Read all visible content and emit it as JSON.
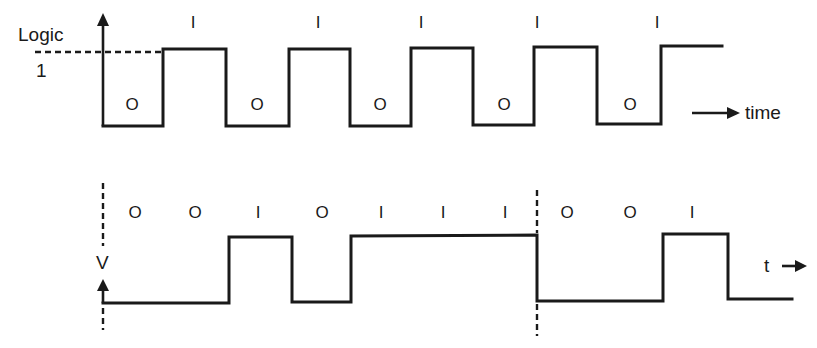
{
  "colors": {
    "ink": "#1a1a1a",
    "background": "#ffffff"
  },
  "top_diagram": {
    "y_axis_label": "Logic",
    "level_label": "1",
    "x_axis_label": "time",
    "axis_x": 103,
    "high_y": 49,
    "low_y": 126,
    "waveform_points": "103,126 163,126 163,49 226,49 226,126 289,126 289,49 350,49 350,126 411,126 411,48 473,48 473,125 534,125 534,47 597,47 597,124 661,124 661,46 722,46",
    "bits": [
      {
        "label": "O",
        "x": 132,
        "y": 110
      },
      {
        "label": "I",
        "x": 193,
        "y": 28
      },
      {
        "label": "O",
        "x": 257,
        "y": 110
      },
      {
        "label": "I",
        "x": 318,
        "y": 28
      },
      {
        "label": "O",
        "x": 380,
        "y": 110
      },
      {
        "label": "I",
        "x": 421,
        "y": 28
      },
      {
        "label": "O",
        "x": 504,
        "y": 110
      },
      {
        "label": "I",
        "x": 537,
        "y": 28
      },
      {
        "label": "O",
        "x": 630,
        "y": 110
      },
      {
        "label": "I",
        "x": 657,
        "y": 28
      }
    ]
  },
  "bottom_diagram": {
    "y_axis_label": "V",
    "x_axis_label": "t",
    "axis_x": 103,
    "boundary_x": 537,
    "waveform_points": "103,303 229,303 229,237 292,237 292,302 351,302 351,236 537,235 537,301 663,301 663,234 728,234 728,299 792,299",
    "bits": [
      {
        "label": "O",
        "x": 135,
        "y": 218
      },
      {
        "label": "O",
        "x": 195,
        "y": 218
      },
      {
        "label": "I",
        "x": 258,
        "y": 218
      },
      {
        "label": "O",
        "x": 322,
        "y": 218
      },
      {
        "label": "I",
        "x": 381,
        "y": 218
      },
      {
        "label": "I",
        "x": 443,
        "y": 218
      },
      {
        "label": "I",
        "x": 505,
        "y": 218
      },
      {
        "label": "O",
        "x": 567,
        "y": 218
      },
      {
        "label": "O",
        "x": 630,
        "y": 218
      },
      {
        "label": "I",
        "x": 692,
        "y": 218
      }
    ]
  }
}
